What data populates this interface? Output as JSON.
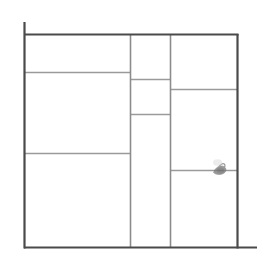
{
  "document": {
    "title": "Rectangular Layout Partition Wireframe",
    "type": "line-drawing",
    "width": 266,
    "height": 265,
    "background_color": "#ffffff"
  },
  "style": {
    "outer_stroke_color": "#4a4a4a",
    "inner_stroke_color": "#9a9a9a",
    "outer_stroke_width": 2,
    "inner_stroke_width": 1.4,
    "smudge_color": "#8a8a8a"
  },
  "frame": {
    "label": "outer-frame",
    "left": 24,
    "top": 34,
    "right": 238,
    "bottom": 248,
    "left_overshoot_top": 22,
    "bottom_overshoot_right": 257
  },
  "columns": [
    {
      "name": "left-column",
      "x_start": 24,
      "x_end": 130
    },
    {
      "name": "middle-column",
      "x_start": 130,
      "x_end": 170
    },
    {
      "name": "right-column",
      "x_start": 170,
      "x_end": 238
    }
  ],
  "vertical_dividers": [
    {
      "name": "vertical-divider-1",
      "x": 130,
      "y_start": 34,
      "y_end": 248
    },
    {
      "name": "vertical-divider-2",
      "x": 170,
      "y_start": 34,
      "y_end": 248
    }
  ],
  "horizontal_dividers": [
    {
      "name": "left-divider-1",
      "column": "left-column",
      "y": 72,
      "x_start": 24,
      "x_end": 130
    },
    {
      "name": "left-divider-2",
      "column": "left-column",
      "y": 153,
      "x_start": 24,
      "x_end": 130
    },
    {
      "name": "middle-divider-1",
      "column": "middle-column",
      "y": 79,
      "x_start": 130,
      "x_end": 170
    },
    {
      "name": "middle-divider-2",
      "column": "middle-column",
      "y": 114,
      "x_start": 130,
      "x_end": 170
    },
    {
      "name": "right-divider-1",
      "column": "right-column",
      "y": 89,
      "x_start": 170,
      "x_end": 238
    },
    {
      "name": "right-divider-2",
      "column": "right-column",
      "y": 170,
      "x_start": 170,
      "x_end": 238
    }
  ],
  "regions": [
    {
      "name": "region-left-top",
      "label": "",
      "x": 24,
      "y": 34,
      "w": 106,
      "h": 38
    },
    {
      "name": "region-left-middle",
      "label": "",
      "x": 24,
      "y": 72,
      "w": 106,
      "h": 81
    },
    {
      "name": "region-left-bottom",
      "label": "",
      "x": 24,
      "y": 153,
      "w": 106,
      "h": 95
    },
    {
      "name": "region-middle-top",
      "label": "",
      "x": 130,
      "y": 34,
      "w": 40,
      "h": 45
    },
    {
      "name": "region-middle-center",
      "label": "",
      "x": 130,
      "y": 79,
      "w": 40,
      "h": 35
    },
    {
      "name": "region-middle-bottom",
      "label": "",
      "x": 130,
      "y": 114,
      "w": 40,
      "h": 134
    },
    {
      "name": "region-right-top",
      "label": "",
      "x": 170,
      "y": 34,
      "w": 68,
      "h": 55
    },
    {
      "name": "region-right-middle",
      "label": "",
      "x": 170,
      "y": 89,
      "w": 68,
      "h": 81
    },
    {
      "name": "region-right-bottom",
      "label": "",
      "x": 170,
      "y": 170,
      "w": 68,
      "h": 78
    }
  ],
  "marker": {
    "name": "pencil-smudge-mark",
    "description": "small dark smudge / pointer mark",
    "x": 218,
    "y": 169,
    "width": 13,
    "height": 12
  }
}
